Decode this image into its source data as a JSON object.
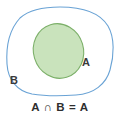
{
  "diagram": {
    "kind": "venn-diagram",
    "caption": "A ∩ B = A",
    "labels": {
      "set_a": "A",
      "set_b": "B"
    },
    "colors": {
      "background": "#ffffff",
      "outer_set_stroke": "#6aa3d5",
      "inner_set_fill": "#c9e3bc",
      "inner_set_stroke": "#7cb069",
      "label_text": "#3a3a3a",
      "caption_text": "#2e2e2e"
    },
    "shapes": {
      "outer_set_b": "rounded-blob",
      "inner_set_a": "tilted-ellipse"
    }
  }
}
